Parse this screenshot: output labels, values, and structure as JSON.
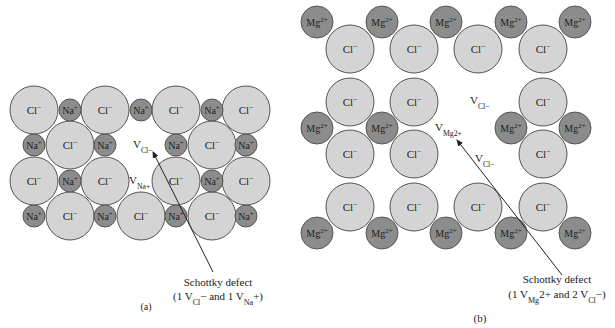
{
  "colors": {
    "anion_fill": "#d4d4d4",
    "cation_fill": "#8c8c8c",
    "outline": "#555555",
    "text": "#222222",
    "background": "#ffffff"
  },
  "panel_a": {
    "label": "(a)",
    "anion_label": "Cl",
    "anion_sup": "−",
    "cation_label": "Na",
    "cation_sup": "+",
    "vacancy_cl": {
      "main": "V",
      "sub": "Cl−"
    },
    "vacancy_na": {
      "main": "V",
      "sub": "Na+"
    },
    "annotation": {
      "line1": "Schottky defect",
      "line2_prefix": "(1 V",
      "line2_sub1": "Cl",
      "line2_mid": "− and 1 V",
      "line2_sub2": "Na",
      "line2_suffix": "+)"
    },
    "grid": [
      [
        "Cl",
        "Na",
        "Cl",
        "Na",
        "Cl",
        "Na",
        "Cl"
      ],
      [
        "Na",
        "Cl",
        "Na",
        "V_Cl",
        "Na",
        "Cl",
        "Na"
      ],
      [
        "Cl",
        "Na",
        "Cl",
        "V_Na",
        "Cl",
        "Na",
        "Cl"
      ],
      [
        "Na",
        "Cl",
        "Na",
        "Cl",
        "Na",
        "Cl",
        "Na"
      ]
    ]
  },
  "panel_b": {
    "label": "(b)",
    "anion_label": "Cl",
    "anion_sup": "−",
    "cation_label": "Mg",
    "cation_sup": "2+",
    "vacancy_cl_1": {
      "main": "V",
      "sub": "Cl−"
    },
    "vacancy_mg": {
      "main": "V",
      "sub": "Mg2+"
    },
    "vacancy_cl_2": {
      "main": "V",
      "sub": "Cl−"
    },
    "annotation": {
      "line1": "Schottky defect",
      "line2_prefix": "(1 V",
      "line2_sub1": "Mg",
      "line2_mid": "2+ and 2 V",
      "line2_sub2": "Cl",
      "line2_suffix": "−)"
    },
    "cation_rows": [
      [
        "Mg",
        "Mg",
        "Mg",
        "Mg",
        "Mg"
      ],
      [
        "Mg",
        "Mg",
        "V_Mg",
        "Mg",
        "Mg"
      ],
      [
        "Mg",
        "Mg",
        "Mg",
        "Mg",
        "Mg"
      ]
    ],
    "anion_rows": [
      [
        "Cl",
        "Cl",
        "Cl",
        "Cl"
      ],
      [
        "Cl",
        "Cl",
        "V_Cl",
        "Cl"
      ],
      [
        "Cl",
        "Cl",
        "V_Cl",
        "Cl"
      ],
      [
        "Cl",
        "Cl",
        "Cl",
        "Cl"
      ]
    ]
  }
}
